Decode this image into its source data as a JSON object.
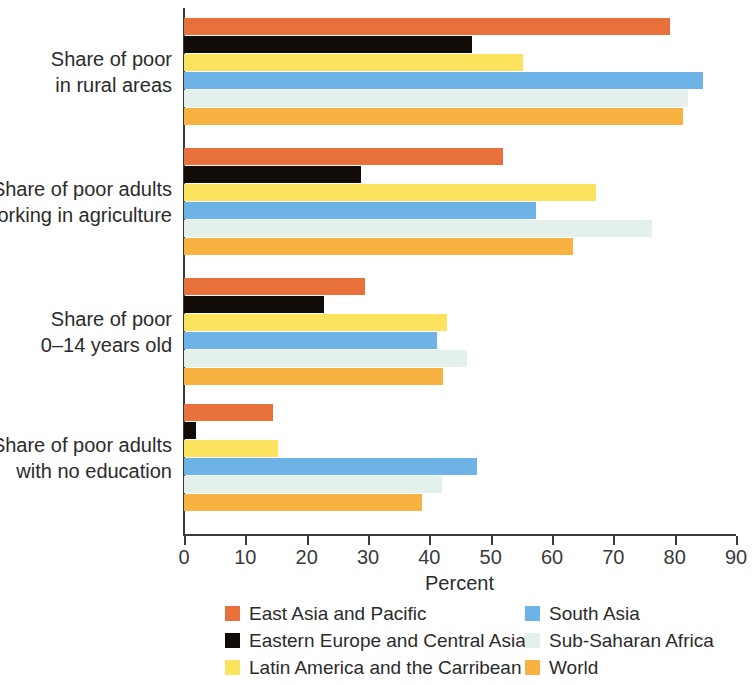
{
  "chart_data": {
    "type": "bar",
    "orientation": "horizontal",
    "title": "",
    "xlabel": "Percent",
    "ylabel": "",
    "xlim": [
      0,
      90
    ],
    "xticks": [
      0,
      10,
      20,
      30,
      40,
      50,
      60,
      70,
      80,
      90
    ],
    "grid": false,
    "legend_position": "bottom",
    "categories": [
      "Share of poor in rural areas",
      "Share of poor adults working in agriculture",
      "Share of poor 0–14 years old",
      "Share of poor adults with no education"
    ],
    "category_lines": [
      [
        "Share of poor",
        "in rural areas"
      ],
      [
        "Share of poor adults",
        "working in agriculture"
      ],
      [
        "Share of poor",
        "0–14 years old"
      ],
      [
        "Share of poor adults",
        "with no education"
      ]
    ],
    "series": [
      {
        "name": "East Asia and Pacific",
        "color": "#E8703A",
        "values": [
          79.2,
          52.0,
          29.5,
          14.5
        ]
      },
      {
        "name": "Eastern Europe and Central Asia",
        "color": "#120C08",
        "values": [
          47.0,
          28.8,
          22.8,
          1.9
        ]
      },
      {
        "name": "Latin America and the Carribean",
        "color": "#FCE35E",
        "values": [
          55.3,
          67.2,
          42.9,
          15.3
        ]
      },
      {
        "name": "South Asia",
        "color": "#6DB3E8",
        "values": [
          84.6,
          57.4,
          41.3,
          47.8
        ]
      },
      {
        "name": "Sub-Saharan Africa",
        "color": "#E3F1EA",
        "values": [
          82.2,
          76.3,
          46.1,
          42.1
        ]
      },
      {
        "name": "World",
        "color": "#F7B241",
        "values": [
          81.4,
          63.4,
          42.2,
          38.8
        ]
      }
    ]
  },
  "legend": {
    "left_column": [
      {
        "label": "East Asia and Pacific",
        "color": "#E8703A"
      },
      {
        "label": "Eastern Europe and Central Asia",
        "color": "#120C08"
      },
      {
        "label": "Latin America and the Carribean",
        "color": "#FCE35E"
      }
    ],
    "right_column": [
      {
        "label": "South Asia",
        "color": "#6DB3E8"
      },
      {
        "label": "Sub-Saharan Africa",
        "color": "#E3F1EA"
      },
      {
        "label": "World",
        "color": "#F7B241"
      }
    ]
  }
}
